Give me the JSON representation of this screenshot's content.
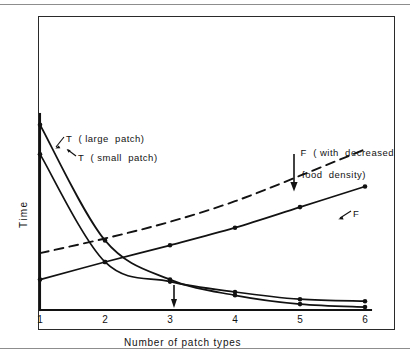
{
  "figure": {
    "background_color": "#ffffff",
    "ink_color": "#121212",
    "rule_color": "#8d8d8d"
  },
  "chart_data": {
    "type": "line",
    "title": "",
    "subtitle": "",
    "xlabel": "Number of patch types",
    "ylabel": "Time",
    "xlim": [
      1,
      6
    ],
    "ylim": [
      0,
      1
    ],
    "xticks": [
      1,
      2,
      3,
      4,
      5,
      6
    ],
    "xtick_labels": [
      "1",
      "2",
      "3",
      "4",
      "5",
      "6"
    ],
    "yticks": [],
    "ytick_labels": [],
    "grid": false,
    "legend": "inline-annotations",
    "x": [
      1,
      2,
      3,
      4,
      5,
      6
    ],
    "series": [
      {
        "name": "T (large patch)",
        "style": "solid",
        "markers": true,
        "values": [
          0.945,
          0.355,
          0.155,
          0.075,
          0.03,
          0.015
        ]
      },
      {
        "name": "T (small patch)",
        "style": "solid",
        "markers": true,
        "values": [
          0.795,
          0.245,
          0.145,
          0.092,
          0.055,
          0.045
        ]
      },
      {
        "name": "F",
        "style": "solid",
        "markers": true,
        "values": [
          0.155,
          0.245,
          0.33,
          0.42,
          0.525,
          0.63
        ]
      },
      {
        "name": "F ( with decreased food density)",
        "style": "dashed",
        "markers": false,
        "values": [
          0.29,
          0.365,
          0.45,
          0.555,
          0.685,
          0.82
        ]
      }
    ],
    "annotations": [
      {
        "name": "t-large-patch-label",
        "text": "T  ( large  patch)",
        "points_to_series": "T (large patch)"
      },
      {
        "name": "t-small-patch-label",
        "text": "T  ( small  patch)",
        "points_to_series": "T (small patch)"
      },
      {
        "name": "f-decreased-density-label",
        "text_line1": "F  ( with  decreased",
        "text_line2": "food  density)",
        "points_to_series": "F ( with decreased food density)"
      },
      {
        "name": "f-label",
        "text": "F",
        "points_to_series": "F"
      },
      {
        "name": "x3-marker-arrow",
        "text": "",
        "at_x": 3
      }
    ]
  }
}
